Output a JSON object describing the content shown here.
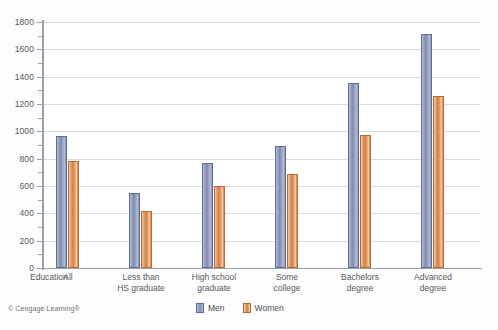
{
  "credit": "© Cengage Learning®",
  "legend": {
    "position": "bottom-center",
    "entries": [
      {
        "label": "Men",
        "color": "#7d8cb2"
      },
      {
        "label": "Women",
        "color": "#d2813f"
      }
    ]
  },
  "axis": {
    "title": "Education",
    "y_major_ticks": [
      "0",
      "200",
      "400",
      "600",
      "800",
      "1000",
      "1200",
      "1400",
      "1600",
      "1800"
    ]
  },
  "chart_data": {
    "type": "bar",
    "title": "",
    "xlabel": "Education",
    "ylabel": "",
    "ylim": [
      0,
      1800
    ],
    "ytick_step": 200,
    "yminor_step": 100,
    "grid": true,
    "legend_position": "bottom-center",
    "categories": [
      "All",
      "Less than\nHS graduate",
      "High school\ngraduate",
      "Some\ncollege",
      "Bachelors\ndegree",
      "Advanced\ndegree"
    ],
    "series": [
      {
        "name": "Men",
        "color": "#7d8cb2",
        "values": [
          965,
          550,
          765,
          895,
          1355,
          1710
        ]
      },
      {
        "name": "Women",
        "color": "#d2813f",
        "values": [
          785,
          420,
          600,
          690,
          975,
          1260
        ]
      }
    ]
  }
}
